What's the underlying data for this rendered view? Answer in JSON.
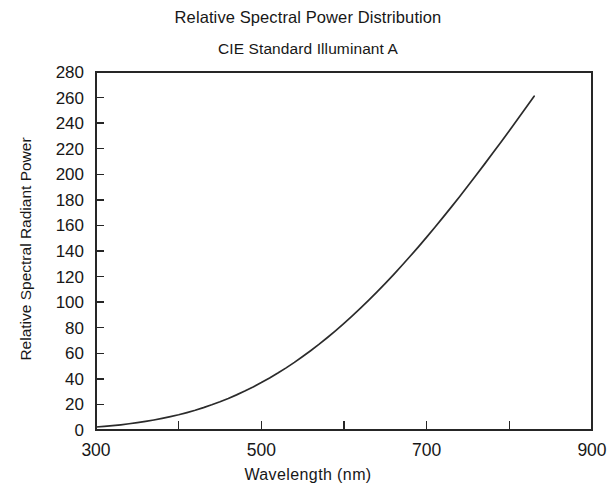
{
  "chart_data": {
    "type": "line",
    "title": "Relative Spectral Power Distribution",
    "subtitle": "CIE Standard Illuminant A",
    "xlabel": "Wavelength  (nm)",
    "ylabel": "Relative Spectral Radiant Power",
    "xlim": [
      300,
      900
    ],
    "ylim": [
      0,
      280
    ],
    "grid": false,
    "legend": "none",
    "x_major_ticks": [
      300,
      500,
      700,
      900
    ],
    "x_minor_ticks": [
      400,
      600,
      800
    ],
    "x_tick_labels": [
      "300",
      "500",
      "700",
      "900"
    ],
    "y_ticks": [
      0,
      20,
      40,
      60,
      80,
      100,
      120,
      140,
      160,
      180,
      200,
      220,
      240,
      260,
      280
    ],
    "y_tick_labels": [
      "0",
      "20",
      "40",
      "60",
      "80",
      "100",
      "120",
      "140",
      "160",
      "180",
      "200",
      "220",
      "240",
      "260",
      "280"
    ],
    "series": [
      {
        "name": "CIE Standard Illuminant A",
        "color": "#2b2b2b",
        "x": [
          300,
          310,
          320,
          330,
          340,
          350,
          360,
          370,
          380,
          390,
          400,
          410,
          420,
          430,
          440,
          450,
          460,
          470,
          480,
          490,
          500,
          510,
          520,
          530,
          540,
          550,
          560,
          570,
          580,
          590,
          600,
          610,
          620,
          630,
          640,
          650,
          660,
          670,
          680,
          690,
          700,
          710,
          720,
          730,
          740,
          750,
          760,
          770,
          780,
          790,
          800,
          810,
          820,
          830
        ],
        "y": [
          0.93,
          1.13,
          1.36,
          1.62,
          1.93,
          2.27,
          2.66,
          3.1,
          3.59,
          4.14,
          4.74,
          5.41,
          6.14,
          6.95,
          7.82,
          8.77,
          9.8,
          10.9,
          12.09,
          13.35,
          14.71,
          16.15,
          17.68,
          19.29,
          20.99,
          22.79,
          24.67,
          26.64,
          28.7,
          30.85,
          33.09,
          35.41,
          37.81,
          40.3,
          42.87,
          45.52,
          48.24,
          51.04,
          53.91,
          56.85,
          59.86,
          62.93,
          66.06,
          69.25,
          72.5,
          75.79,
          79.13,
          82.52,
          85.95,
          89.41,
          92.91,
          96.44,
          100.0,
          103.58
        ]
      }
    ],
    "note": "Curve plotted from 300 nm to approximately 833 nm; values normalized so that 560 nm = 100 and rendered at 2.6x so the peak reads about 261 at the right end of the trace."
  },
  "display": {
    "y_scale_factor": 2.52,
    "curve_end_wavelength": 833,
    "curve_end_value": 261
  }
}
